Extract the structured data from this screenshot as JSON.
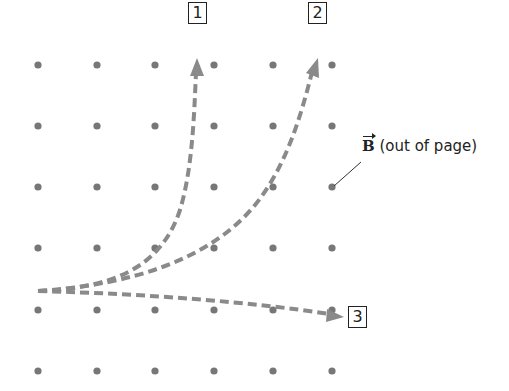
{
  "figure": {
    "field_label": {
      "symbol": "B",
      "text": " (out of page)"
    },
    "path_labels": [
      "1",
      "2",
      "3"
    ],
    "colors": {
      "dot": "#777777",
      "path": "#8a8a8a",
      "box": "#222222",
      "leader": "#333333"
    },
    "dot_grid": {
      "columns_x": [
        38,
        97,
        155,
        214,
        273,
        332
      ],
      "rows_y": [
        65,
        126,
        187,
        248,
        310,
        371
      ]
    }
  }
}
